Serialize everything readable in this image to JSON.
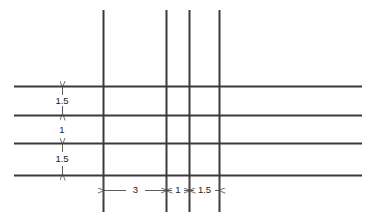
{
  "diagram": {
    "type": "engineering-dimension-drawing",
    "background_color": "#ffffff",
    "line_color": "#3a3a3a",
    "dim_line_color": "#4a4a4a",
    "text_color": "#1a1a1a",
    "canvas": {
      "width": 375,
      "height": 218
    },
    "horizontal_lines": [
      {
        "name": "horizontal-line-1",
        "y": 86,
        "x1": 14,
        "x2": 362
      },
      {
        "name": "horizontal-line-2",
        "y": 115,
        "x1": 14,
        "x2": 362
      },
      {
        "name": "horizontal-line-3",
        "y": 143,
        "x1": 14,
        "x2": 362
      },
      {
        "name": "horizontal-line-4",
        "y": 175,
        "x1": 14,
        "x2": 362
      }
    ],
    "vertical_lines": [
      {
        "name": "vertical-line-1",
        "x": 103,
        "y1": 10,
        "y2": 212
      },
      {
        "name": "vertical-line-2",
        "x": 166,
        "y1": 10,
        "y2": 212
      },
      {
        "name": "vertical-line-3",
        "x": 189,
        "y1": 10,
        "y2": 212
      },
      {
        "name": "vertical-line-4",
        "x": 219,
        "y1": 10,
        "y2": 212
      }
    ],
    "vertical_dimensions": [
      {
        "name": "vertical-dimension-1",
        "label": "1.5",
        "x": 62,
        "y_top": 86,
        "y_bottom": 115,
        "label_x": 62,
        "label_y": 100
      },
      {
        "name": "vertical-dimension-2",
        "label": "1",
        "x": 62,
        "y_top": 115,
        "y_bottom": 143,
        "label_x": 62,
        "label_y": 130
      },
      {
        "name": "vertical-dimension-3",
        "label": "1.5",
        "x": 62,
        "y_top": 143,
        "y_bottom": 175,
        "label_x": 62,
        "label_y": 159
      }
    ],
    "horizontal_dimensions": [
      {
        "name": "horizontal-dimension-3",
        "label": "3",
        "y": 190,
        "x_left": 103,
        "x_right": 166,
        "label_x": 135,
        "label_y": 190
      },
      {
        "name": "horizontal-dimension-1",
        "label": "1",
        "y": 190,
        "x_left": 166,
        "x_right": 189,
        "label_x": 178,
        "label_y": 190
      },
      {
        "name": "horizontal-dimension-1-5",
        "label": "1.5",
        "y": 190,
        "x_left": 189,
        "x_right": 219,
        "label_x": 204,
        "label_y": 190
      }
    ],
    "extension_ticks": {
      "name": "extension-ticks",
      "bottom_y_top": 178,
      "bottom_y_bottom": 200
    }
  }
}
